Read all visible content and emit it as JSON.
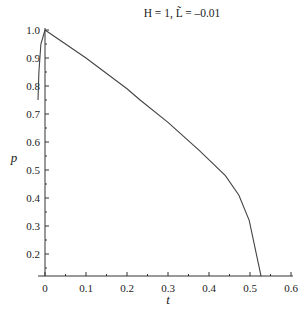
{
  "chart_data": {
    "type": "line",
    "title": "H = 1, L̃ = –0.01",
    "xlabel": "t",
    "ylabel": "p",
    "xlim": [
      -0.01,
      0.6
    ],
    "ylim": [
      0.12,
      1.0
    ],
    "grid": false,
    "legend": null,
    "x_ticks": [
      "0",
      "0.1",
      "0.2",
      "0.3",
      "0.4",
      "0.5",
      "0.6"
    ],
    "y_ticks": [
      "0.2",
      "0.3",
      "0.4",
      "0.5",
      "0.6",
      "0.7",
      "0.8",
      "0.9",
      "1.0"
    ],
    "series": [
      {
        "name": "main branch",
        "x": [
          0,
          0.1,
          0.2,
          0.232,
          0.3,
          0.376,
          0.44,
          0.473,
          0.498,
          0.527
        ],
        "y": [
          1.0,
          0.9,
          0.79,
          0.75,
          0.67,
          0.57,
          0.48,
          0.41,
          0.32,
          0.12
        ]
      },
      {
        "name": "short branch",
        "x": [
          0,
          -0.01,
          -0.015,
          -0.017
        ],
        "y": [
          1.0,
          0.95,
          0.85,
          0.75
        ]
      }
    ]
  }
}
